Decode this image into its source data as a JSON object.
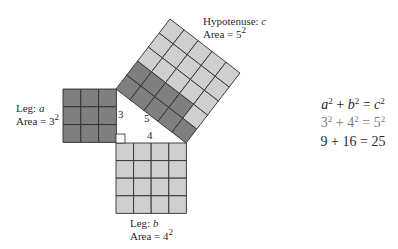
{
  "colors": {
    "dark_cell": "#7f7f7f",
    "light_cell": "#cfcfcf",
    "grid_line": "#2e2e2e",
    "background": "#ffffff"
  },
  "labels": {
    "leg_a": {
      "title_prefix": "Leg: ",
      "var": "a",
      "area_prefix": "Area = ",
      "base": "3",
      "exp": "2"
    },
    "leg_b": {
      "title_prefix": "Leg: ",
      "var": "b",
      "area_prefix": "Area = ",
      "base": "4",
      "exp": "2"
    },
    "hypotenuse": {
      "title_prefix": "Hypotenuse: ",
      "var": "c",
      "area_prefix": "Area = ",
      "base": "5",
      "exp": "2"
    }
  },
  "side_labels": {
    "a": "3",
    "b": "4",
    "c": "5"
  },
  "equations": {
    "line1": {
      "t1": "a",
      "e1": "2",
      "op1": " + ",
      "t2": "b",
      "e2": "2",
      "op2": " = ",
      "t3": "c",
      "e3": "2"
    },
    "line2": {
      "t1": "3",
      "e1": "2",
      "op1": " + ",
      "t2": "4",
      "e2": "2",
      "op2": " = ",
      "t3": "5",
      "e3": "2"
    },
    "line3": {
      "text": "9 + 16 = 25"
    }
  },
  "figure": {
    "square_a": {
      "x": 63,
      "y": 89,
      "n": 3,
      "cell": 17.8
    },
    "square_b": {
      "x": 116,
      "y": 143,
      "n": 4,
      "cell": 17.6
    },
    "square_c": {
      "origin": [
        116,
        89
      ],
      "u": [
        70,
        54
      ],
      "v": [
        54,
        -70
      ],
      "n": 5,
      "dark_rows": [
        [
          0,
          1,
          2,
          3,
          4
        ],
        [
          0,
          1,
          2,
          3
        ]
      ]
    }
  }
}
